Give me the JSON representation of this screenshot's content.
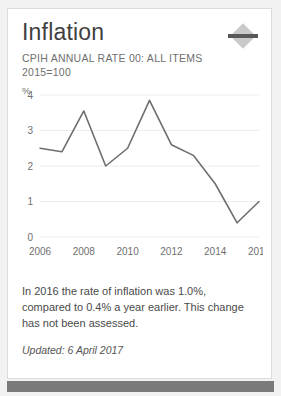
{
  "card": {
    "title": "Inflation",
    "subtitle": "CPIH ANNUAL RATE 00: ALL ITEMS 2015=100",
    "collapse_icon": "collapse-diamond-icon",
    "description": "In 2016 the rate of inflation was 1.0%, compared to 0.4% a year earlier. This change has not been assessed.",
    "updated": "Updated: 6 April 2017",
    "line_color": "#6e6e6e",
    "grid_color": "#ededed",
    "axis_text_color": "#707070",
    "footer_color": "#7a7a7a"
  },
  "chart_data": {
    "type": "line",
    "title": "",
    "xlabel": "",
    "ylabel": "%",
    "ylim": [
      0,
      4
    ],
    "xlim": [
      2006,
      2016
    ],
    "grid": true,
    "legend": "none",
    "y_ticks": [
      "0",
      "1",
      "2",
      "3",
      "4"
    ],
    "y_tick_values": [
      0,
      1,
      2,
      3,
      4
    ],
    "x_ticks": [
      "2006",
      "2008",
      "2010",
      "2012",
      "2014",
      "2016"
    ],
    "x_tick_values": [
      2006,
      2008,
      2010,
      2012,
      2014,
      2016
    ],
    "x": [
      2006,
      2007,
      2008,
      2009,
      2010,
      2011,
      2012,
      2013,
      2014,
      2015,
      2016
    ],
    "values": [
      2.5,
      2.4,
      3.55,
      2.0,
      2.5,
      3.85,
      2.6,
      2.3,
      1.5,
      0.4,
      1.0
    ],
    "series": [
      {
        "name": "CPIH annual rate",
        "values": [
          2.5,
          2.4,
          3.55,
          2.0,
          2.5,
          3.85,
          2.6,
          2.3,
          1.5,
          0.4,
          1.0
        ]
      }
    ]
  }
}
